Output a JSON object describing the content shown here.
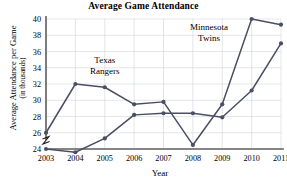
{
  "chart_data": {
    "type": "line",
    "title": "Average Game Attendance",
    "xlabel": "Year",
    "ylabel": "Average Attendance per Game",
    "ylabel_sub": "(in thousands)",
    "x": [
      2003,
      2004,
      2005,
      2006,
      2007,
      2008,
      2009,
      2010,
      2011
    ],
    "xtick_labels": [
      "2003",
      "2004",
      "2005",
      "2006",
      "2007",
      "2008",
      "2009",
      "2010",
      "2011"
    ],
    "ytick_labels": [
      "24",
      "26",
      "28",
      "30",
      "32",
      "34",
      "36",
      "38",
      "40"
    ],
    "ylim": [
      24,
      40
    ],
    "xlim": [
      2003,
      2011
    ],
    "ytick_step": 2,
    "grid": true,
    "y_axis_break": true,
    "legend_position": "inline-annotations",
    "series": [
      {
        "name": "Minnesota Twins",
        "values": [
          26,
          32,
          31.6,
          29.5,
          29.8,
          24.5,
          29.5,
          40,
          39.3
        ],
        "color": "#4a4f63"
      },
      {
        "name": "Texas Rangers",
        "values": [
          24,
          23.6,
          25.3,
          28.2,
          28.4,
          28.4,
          27.9,
          31.2,
          37
        ],
        "color": "#4a4f63"
      }
    ],
    "annotations": [
      {
        "text_line1": "Texas",
        "text_line2": "Rangers",
        "x": 2005,
        "y": 34.6
      },
      {
        "text_line1": "Minnesota",
        "text_line2": "Twins",
        "x": 2008.55,
        "y": 38.6
      }
    ]
  }
}
